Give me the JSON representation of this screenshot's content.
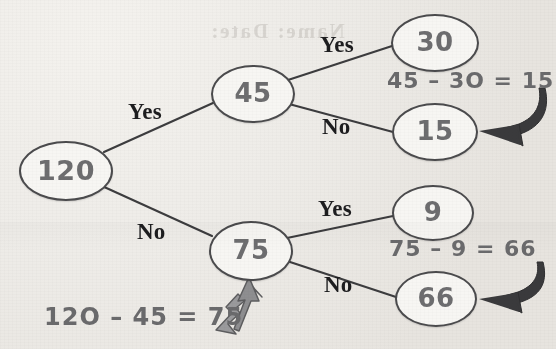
{
  "diagram": {
    "ghost_text": "Name:  Date:",
    "colors": {
      "background": "#eeece8",
      "node_fill": "#f7f6f3",
      "node_stroke": "#4b4b4d",
      "node_text": "#6d6d6f",
      "edge": "#3c3c3e",
      "label_text": "#1d1d1f",
      "equation_text": "#6a6a6c",
      "arrow_dark": "#3a3a3c",
      "arrow_outline_fill": "#9a9a9c"
    },
    "nodes": [
      {
        "id": "root",
        "label": "120",
        "x": 64,
        "y": 169,
        "rx": 45,
        "ry": 28,
        "font_size": 27
      },
      {
        "id": "n45",
        "label": "45",
        "x": 251,
        "y": 92,
        "rx": 40,
        "ry": 27,
        "font_size": 26
      },
      {
        "id": "n30",
        "label": "30",
        "x": 433,
        "y": 41,
        "rx": 42,
        "ry": 27,
        "font_size": 26
      },
      {
        "id": "n15",
        "label": "15",
        "x": 433,
        "y": 130,
        "rx": 41,
        "ry": 27,
        "font_size": 26
      },
      {
        "id": "n75",
        "label": "75",
        "x": 249,
        "y": 249,
        "rx": 40,
        "ry": 28,
        "font_size": 26
      },
      {
        "id": "n9",
        "label": "9",
        "x": 431,
        "y": 211,
        "rx": 39,
        "ry": 26,
        "font_size": 26
      },
      {
        "id": "n66",
        "label": "66",
        "x": 434,
        "y": 297,
        "rx": 39,
        "ry": 26,
        "font_size": 26
      }
    ],
    "edges": [
      {
        "id": "root-yes",
        "from": "root",
        "to": "n45",
        "label": "Yes"
      },
      {
        "id": "root-no",
        "from": "root",
        "to": "n75",
        "label": "No"
      },
      {
        "id": "n45-yes",
        "from": "n45",
        "to": "n30",
        "label": "Yes"
      },
      {
        "id": "n45-no",
        "from": "n45",
        "to": "n15",
        "label": "No"
      },
      {
        "id": "n75-yes",
        "from": "n75",
        "to": "n9",
        "label": "Yes"
      },
      {
        "id": "n75-no",
        "from": "n75",
        "to": "n66",
        "label": "No"
      }
    ],
    "branch_labels": [
      {
        "id": "yes-root",
        "text": "Yes",
        "x": 128,
        "y": 99
      },
      {
        "id": "yes-45",
        "text": "Yes",
        "x": 320,
        "y": 32
      },
      {
        "id": "no-45",
        "text": "No",
        "x": 322,
        "y": 114
      },
      {
        "id": "no-root",
        "text": "No",
        "x": 137,
        "y": 219
      },
      {
        "id": "yes-75",
        "text": "Yes",
        "x": 318,
        "y": 196
      },
      {
        "id": "no-75",
        "text": "No",
        "x": 324,
        "y": 272
      }
    ],
    "equations": [
      {
        "id": "eq-45-30",
        "text": "45 – 3O = 15",
        "x": 387,
        "y": 68,
        "font_size": 22
      },
      {
        "id": "eq-75-9",
        "text": "75 – 9 = 66",
        "x": 389,
        "y": 236,
        "font_size": 22
      },
      {
        "id": "eq-120-45",
        "text": "12O – 45 = 75",
        "x": 44,
        "y": 303,
        "font_size": 24
      }
    ],
    "arrows": [
      {
        "id": "arrow-to-15",
        "style": "filled-dark",
        "points_to": "n15"
      },
      {
        "id": "arrow-to-66",
        "style": "filled-dark",
        "points_to": "n66"
      },
      {
        "id": "arrow-to-75",
        "style": "outlined-gray",
        "points_to": "n75"
      }
    ]
  }
}
